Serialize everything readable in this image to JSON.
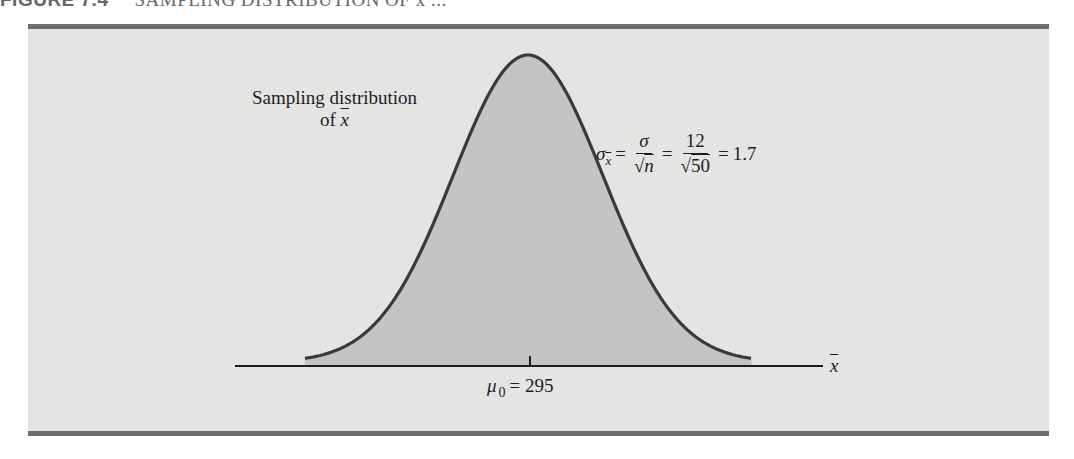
{
  "figure": {
    "number": "FIGURE 7.4",
    "title": "SAMPLING DISTRIBUTION OF x̄ ..."
  },
  "labels": {
    "distribution_line1": "Sampling distribution",
    "distribution_line2_prefix": "of ",
    "distribution_line2_var": "x",
    "formula": {
      "lhs_symbol": "σ",
      "lhs_subscript": "x",
      "eq1": "=",
      "frac1_num": "σ",
      "frac1_den_root": "√",
      "frac1_den": "n",
      "eq2": "=",
      "frac2_num": "12",
      "frac2_den_root": "√",
      "frac2_den": "50",
      "eq3": "=",
      "result": "1.7"
    },
    "mean": {
      "symbol": "μ",
      "subscript": "0",
      "eq": "=",
      "value": "295"
    },
    "axis_var": "x"
  },
  "colors": {
    "panel_bg": "#e4e4e3",
    "frame": "#6e6e6e",
    "curve_fill": "#c4c4c4",
    "curve_stroke": "#3a3a3a",
    "axis": "#1d1d1d"
  },
  "chart_data": {
    "type": "area",
    "title": "Sampling distribution of x̄",
    "distribution": "normal",
    "mean": 295,
    "mean_label": "μ0 = 295",
    "std_error": 1.7,
    "std_error_formula": "σx̄ = σ/√n = 12/√50 = 1.7",
    "sigma": 12,
    "n": 50,
    "xlabel": "x̄",
    "ylabel": "",
    "x_ticks": [
      295
    ],
    "shaded_region": "entire curve",
    "grid": false,
    "legend": "none"
  }
}
